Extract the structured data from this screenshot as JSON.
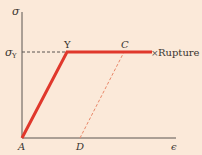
{
  "diagram": {
    "axes": {
      "y_label": "σ",
      "x_label": "ϵ",
      "yield_stress_label": "σ",
      "yield_stress_subscript": "Y"
    },
    "points": {
      "A": "A",
      "Y": "Y",
      "C": "C",
      "D": "D"
    },
    "rupture_marker": "×",
    "rupture_label": "Rupture",
    "colors": {
      "background": "#fbe9d9",
      "axis": "#5a5550",
      "curve": "#e0382c",
      "unload_dashed": "#e8886a",
      "yield_dashed": "#5a5550",
      "text": "#3a3530"
    }
  }
}
